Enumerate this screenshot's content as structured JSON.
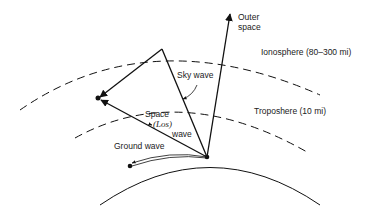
{
  "diagram": {
    "labels": {
      "outer_space_line1": "Outer",
      "outer_space_line2": "space",
      "ionosphere": "Ionosphere (80–300 mi)",
      "troposphere": "Troposhere (10 mi)",
      "sky_wave": "Sky wave",
      "space_wave_line1": "Space",
      "space_wave_line2_open": "(",
      "space_wave_los": "Los",
      "space_wave_line2_close": ")",
      "space_wave_line3": "wave",
      "ground_wave": "Ground wave"
    },
    "colors": {
      "stroke": "#111111",
      "background": "#ffffff"
    }
  }
}
